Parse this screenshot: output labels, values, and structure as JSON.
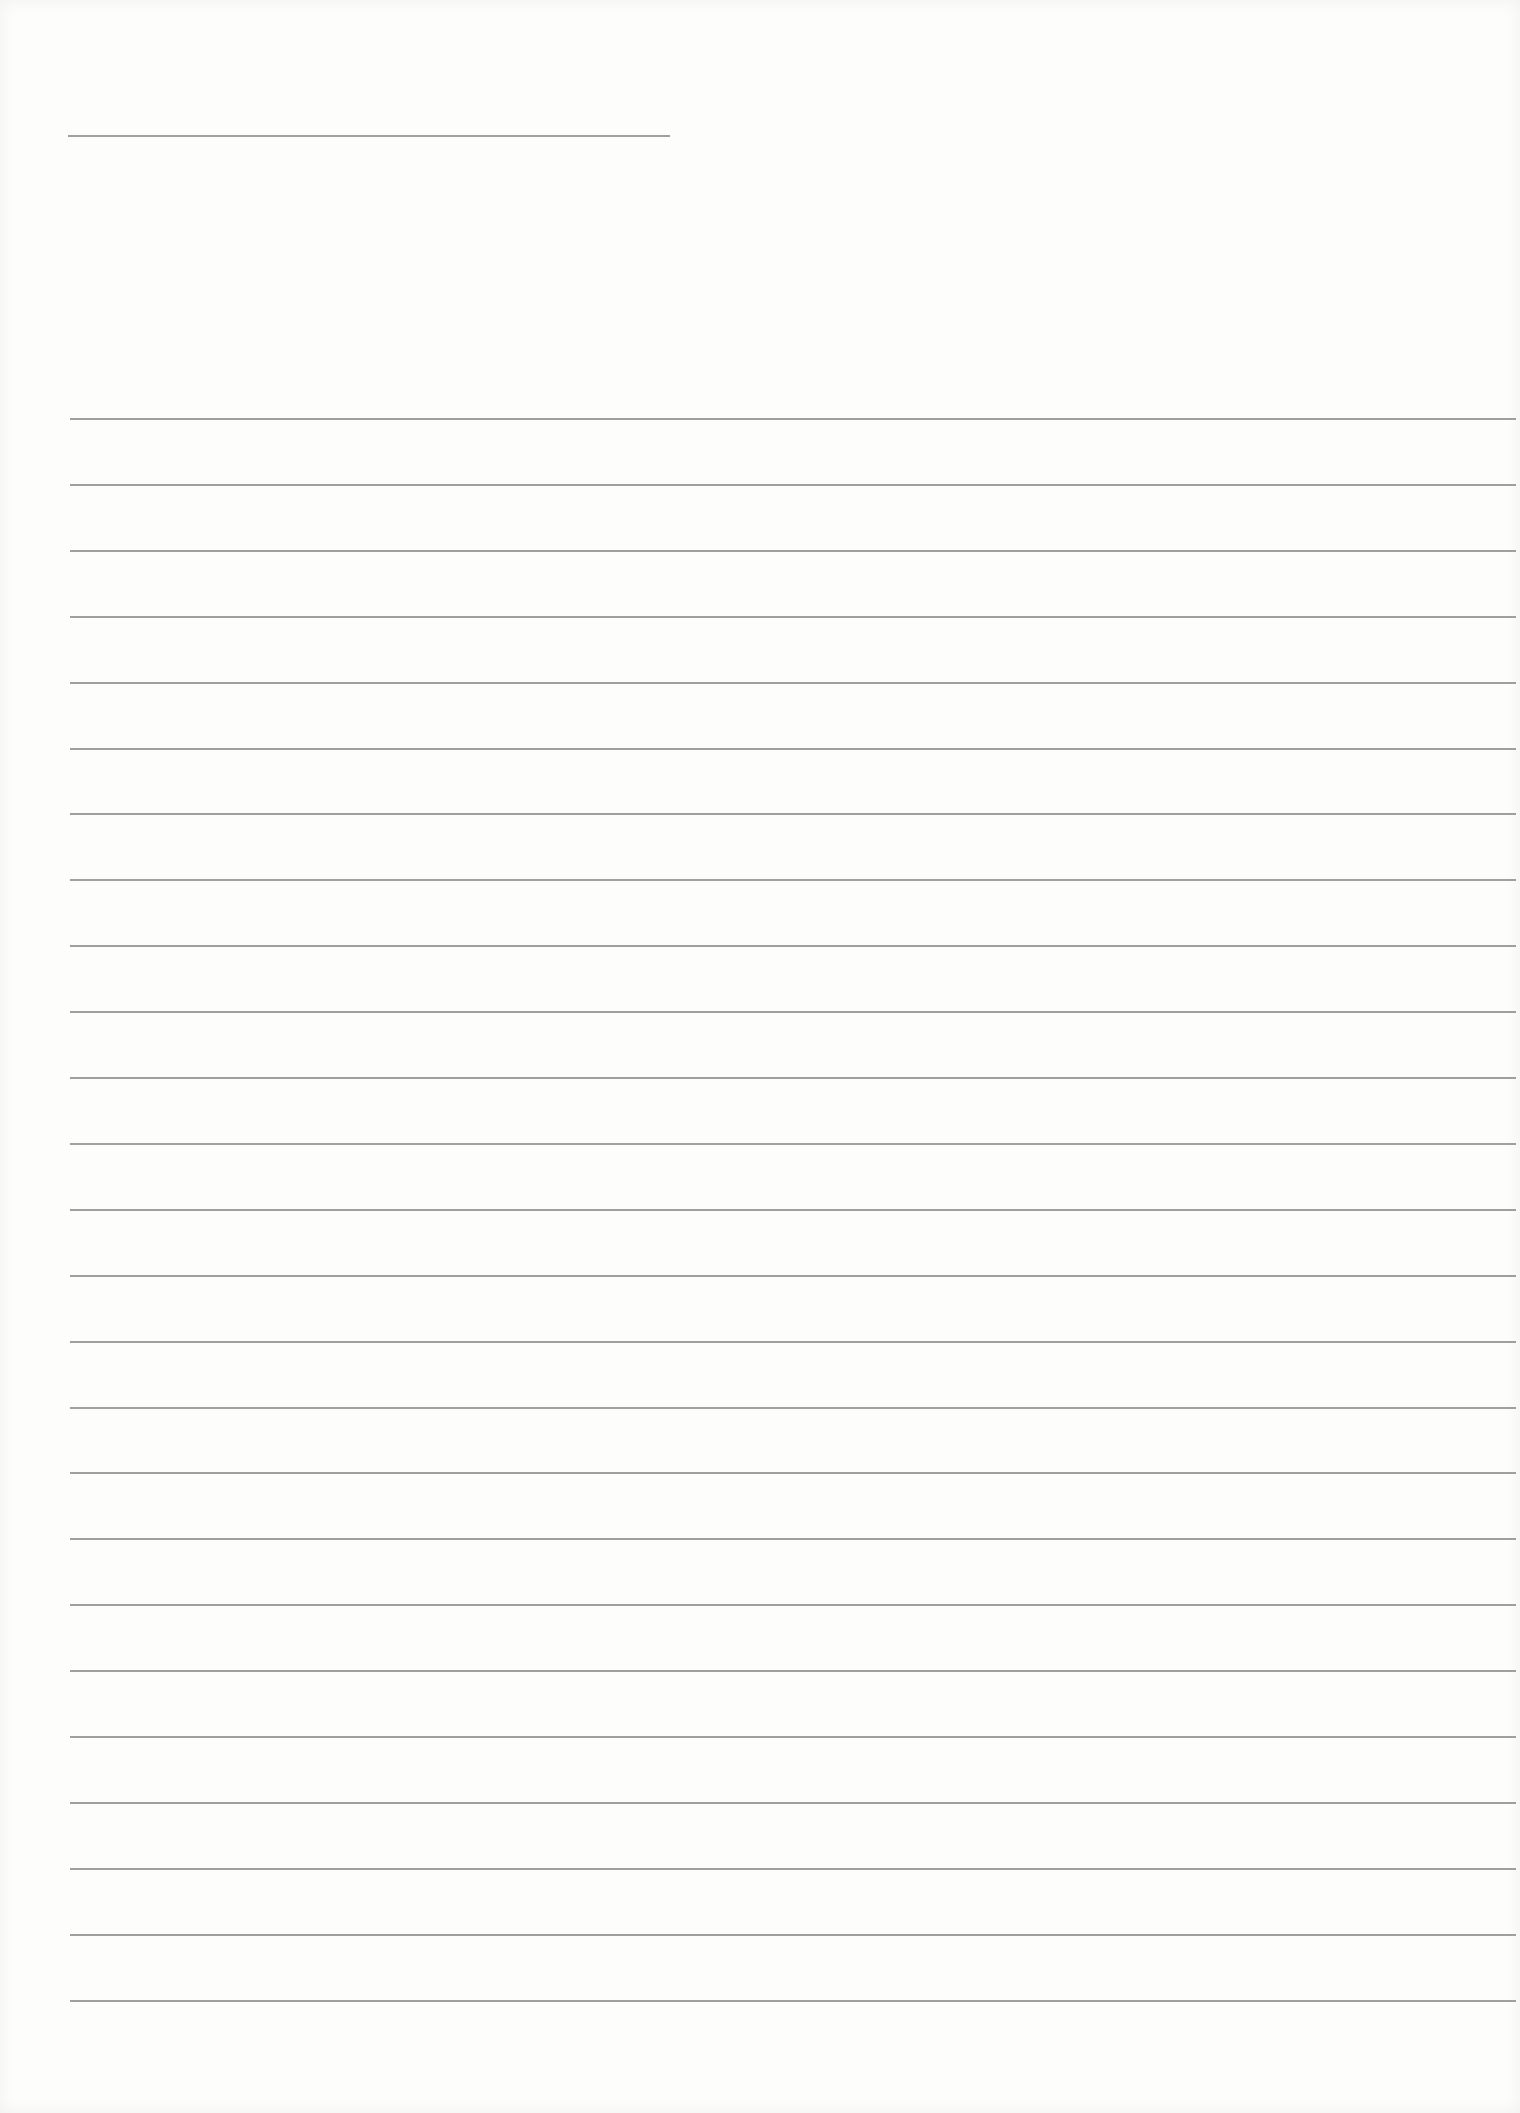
{
  "page": {
    "type": "blank-lined-sheet",
    "width": 1520,
    "height": 2113,
    "background_color": "#fdfdfc",
    "line_color": "#8e8e8e"
  },
  "header": {
    "title_line": {
      "text": "",
      "x": 68,
      "y": 135,
      "length": 602
    }
  },
  "body": {
    "line_count": 25,
    "first_line_y": 418,
    "line_spacing": 65.9,
    "line_left": 70,
    "line_right": 1516,
    "lines_text": [
      "",
      "",
      "",
      "",
      "",
      "",
      "",
      "",
      "",
      "",
      "",
      "",
      "",
      "",
      "",
      "",
      "",
      "",
      "",
      "",
      "",
      "",
      "",
      "",
      ""
    ]
  }
}
